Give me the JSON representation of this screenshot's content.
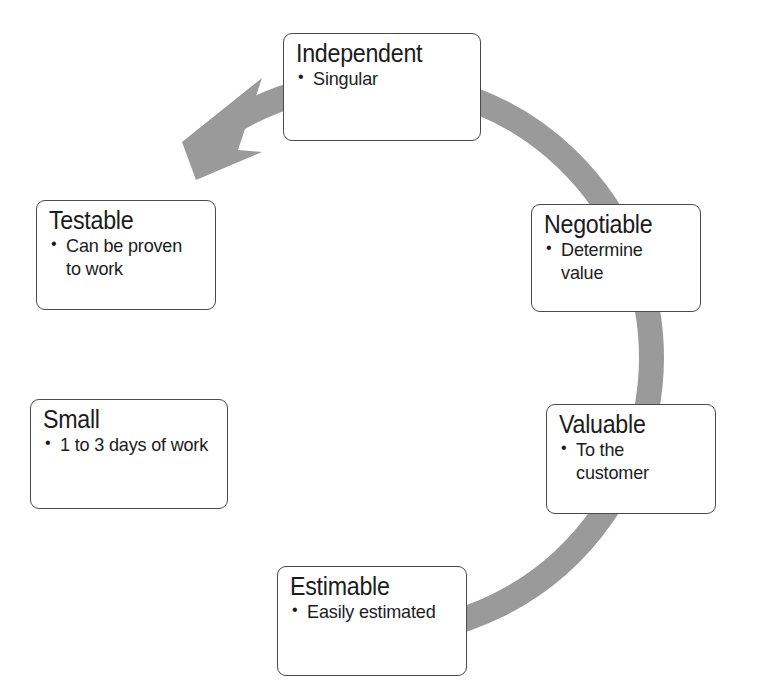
{
  "diagram": {
    "type": "cycle-diagram",
    "colors": {
      "ring": "#9a9a9a",
      "box_border": "#4a4a4a",
      "box_fill": "#ffffff",
      "text": "#1c1c1c",
      "background": "#ffffff"
    },
    "ring": {
      "name": "clockwise-cycle-arrow",
      "direction": "clockwise",
      "arrowhead_position": "top-left"
    },
    "nodes": [
      {
        "id": "independent",
        "title": "Independent",
        "bullets": [
          "Singular"
        ],
        "position": "top"
      },
      {
        "id": "negotiable",
        "title": "Negotiable",
        "bullets": [
          "Determine value"
        ],
        "position": "upper-right"
      },
      {
        "id": "valuable",
        "title": "Valuable",
        "bullets": [
          "To the customer"
        ],
        "position": "lower-right"
      },
      {
        "id": "estimable",
        "title": "Estimable",
        "bullets": [
          "Easily estimated"
        ],
        "position": "bottom"
      },
      {
        "id": "small",
        "title": "Small",
        "bullets": [
          "1 to 3 days of work"
        ],
        "position": "lower-left"
      },
      {
        "id": "testable",
        "title": "Testable",
        "bullets": [
          "Can be proven to work"
        ],
        "position": "upper-left"
      }
    ]
  }
}
